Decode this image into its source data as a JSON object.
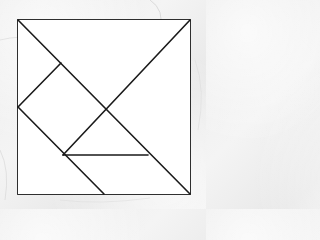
{
  "diagram": {
    "type": "tangram",
    "background_color": "#efefef",
    "fill_color": "#ffffff",
    "stroke_color": "#1a1a1a",
    "stroke_width": 1.6,
    "outer_square": {
      "x": 18,
      "y": 20,
      "width": 172,
      "height": 174
    },
    "pieces": [
      {
        "name": "large-triangle-top",
        "points": "18,20 190,20 105,107"
      },
      {
        "name": "large-triangle-right",
        "points": "190,20 190,194 105,107"
      },
      {
        "name": "small-square",
        "points": "61,63 18,107 63,155 105,107"
      },
      {
        "name": "small-triangle-left-top",
        "points": "18,20 61,63 18,107"
      },
      {
        "name": "medium-triangle-center",
        "points": "105,107 63,155 148,155"
      },
      {
        "name": "parallelogram-bottom-left",
        "points": "18,107 63,155 104,194 18,194"
      },
      {
        "name": "small-triangle-bottom",
        "points": "63,155 148,155 190,194 104,194"
      }
    ],
    "lines": [
      {
        "name": "main-diagonal",
        "x1": 18,
        "y1": 20,
        "x2": 190,
        "y2": 194
      },
      {
        "name": "anti-diagonal",
        "x1": 190,
        "y1": 20,
        "x2": 63,
        "y2": 155
      },
      {
        "name": "square-upper-left-edge",
        "x1": 61,
        "y1": 63,
        "x2": 18,
        "y2": 107
      },
      {
        "name": "lower-left-diagonal",
        "x1": 18,
        "y1": 107,
        "x2": 104,
        "y2": 194
      },
      {
        "name": "horizontal-segment",
        "x1": 63,
        "y1": 155,
        "x2": 148,
        "y2": 155
      }
    ]
  }
}
